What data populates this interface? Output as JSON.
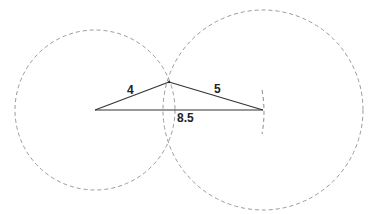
{
  "diagram": {
    "type": "geometric-construction",
    "colors": {
      "circle_stroke": "#9a9a9a",
      "segment_stroke": "#333333",
      "label": "#222222",
      "background": "#ffffff"
    },
    "points": {
      "A": {
        "x": 95,
        "y": 110
      },
      "B": {
        "x": 263,
        "y": 110
      },
      "C": {
        "x": 169,
        "y": 82
      }
    },
    "circles": [
      {
        "name": "circle-radius-4",
        "cx": 95,
        "cy": 110,
        "r": 80
      },
      {
        "name": "circle-radius-5",
        "cx": 263,
        "cy": 110,
        "r": 100
      }
    ],
    "segments": [
      {
        "name": "side-4",
        "from": "A",
        "to": "C",
        "label": "4",
        "label_x": 127,
        "label_y": 94
      },
      {
        "name": "side-5",
        "from": "C",
        "to": "B",
        "label": "5",
        "label_x": 214,
        "label_y": 93
      },
      {
        "name": "side-8-5",
        "from": "A",
        "to": "B",
        "label": "8.5",
        "label_x": 177,
        "label_y": 122
      }
    ],
    "endpoint_arc": {
      "x": 263,
      "y1": 90,
      "y2": 134
    }
  }
}
